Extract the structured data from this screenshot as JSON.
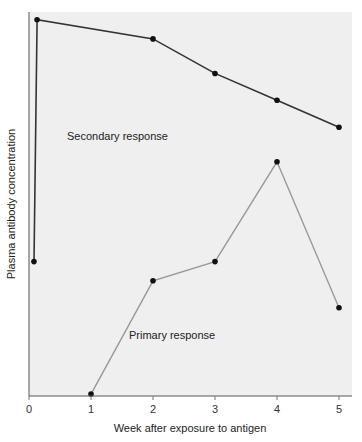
{
  "chart_data": {
    "type": "line",
    "title": "",
    "xlabel": "Week after exposure to antigen",
    "ylabel": "Plasma antibody concentration",
    "x_ticks": [
      0,
      1,
      2,
      3,
      4,
      5
    ],
    "xlim": [
      0,
      5.2
    ],
    "ylim": [
      0,
      100
    ],
    "y_ticks": [],
    "grid": false,
    "legend": "inline labels",
    "series": [
      {
        "name": "Secondary response",
        "color": "#333333",
        "x": [
          0.08,
          0.13,
          2,
          3,
          4,
          5
        ],
        "values": [
          35,
          98,
          93,
          84,
          77,
          70
        ]
      },
      {
        "name": "Primary response",
        "color": "#999999",
        "x": [
          1,
          2,
          3,
          4,
          5
        ],
        "values": [
          0.5,
          30,
          35,
          61,
          23
        ]
      }
    ],
    "annotations": [
      {
        "text": "Secondary response",
        "x": 0.6,
        "y": 69
      },
      {
        "text": "Primary response",
        "x": 1.6,
        "y": 17
      }
    ]
  },
  "plot": {
    "background": "#efefef",
    "axis_color": "#555555",
    "marker_color": "#111111"
  }
}
